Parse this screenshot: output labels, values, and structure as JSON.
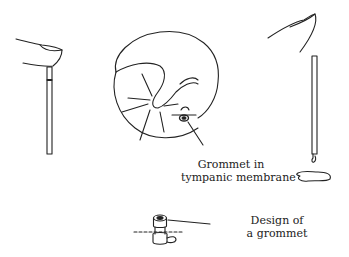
{
  "figure": {
    "labels": {
      "grommet_in_tm_line1": "Grommet in",
      "grommet_in_tm_line2": "tympanic membrane",
      "design_line1": "Design of",
      "design_line2": "a grommet"
    },
    "panels": [
      {
        "id": "left",
        "depicts": "finger occluding top of straw, fluid held in tube"
      },
      {
        "id": "center",
        "depicts": "tympanic membrane with grommet inserted"
      },
      {
        "id": "right",
        "depicts": "finger released, fluid drains from straw to puddle"
      },
      {
        "id": "bottom",
        "depicts": "grommet design detail"
      }
    ],
    "colors": {
      "stroke": "#222222",
      "background": "#ffffff"
    }
  }
}
